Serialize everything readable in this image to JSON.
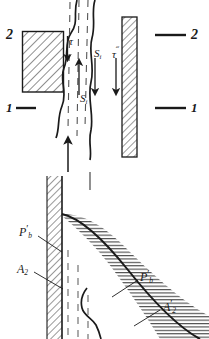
{
  "figure": {
    "type": "technical-diagram",
    "stroke_color": "#1a1a1a",
    "hatch_color": "#333333",
    "background": "#ffffff"
  },
  "upper_panel": {
    "section_markers": {
      "top_left": "2",
      "top_right": "2",
      "bottom_left": "1",
      "bottom_right": "1"
    },
    "labels": {
      "tau_left": "τ",
      "tau_right_base": "τ",
      "tau_right_prime": "˝",
      "s_upper_base": "S",
      "s_upper_sub": "i",
      "s_lower_base": "S",
      "s_lower_sub": "i"
    },
    "solid_block": {
      "label": "left-hatched-block"
    },
    "right_wall": {
      "label": "right-hatched-wall"
    }
  },
  "lower_panel": {
    "labels": {
      "pb_left_base": "P",
      "pb_left_sub": "b",
      "pb_left_prime": "′",
      "a2_left_base": "A",
      "a2_left_sub": "2",
      "a2_left_prime": "",
      "pb_right_base": "P",
      "pb_right_sub": "b",
      "pb_right_prime": "′",
      "a2_right_base": "A",
      "a2_right_sub": "2",
      "a2_right_prime": "′"
    },
    "wall": {
      "label": "vertical-hatched-wall"
    },
    "boundary_curve": {
      "label": "curved-boundary-line"
    }
  }
}
